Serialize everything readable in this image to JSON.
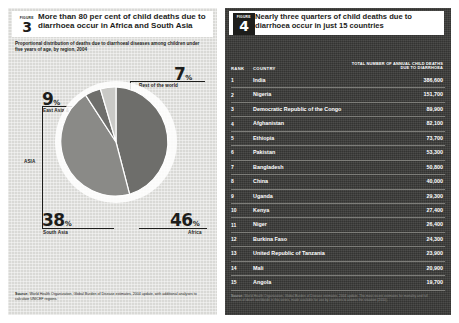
{
  "left": {
    "figure_word": "FIGURE",
    "figure_number": "3",
    "title": "More than 80 per cent of child deaths due to diarrhoea occur in Africa and South Asia",
    "subtitle": "Proportional distribution of deaths due to diarrhoeal diseases among children under five years of age, by region, 2004",
    "asia_bracket_label": "ASIA",
    "source_label": "Source:",
    "source_text": "World Health Organization, Global Burden of Disease estimates, 2004 update, with additional analyses to calculate UNICEF regions."
  },
  "right": {
    "figure_word": "FIGURE",
    "figure_number": "4",
    "title": "Nearly three quarters of child deaths due to diarrhoea occur in just 15 countries",
    "columns": {
      "rank": "RANK",
      "country": "COUNTRY",
      "deaths": "TOTAL NUMBER OF ANNUAL CHILD DEATHS DUE TO DIARRHOEA"
    },
    "rows": [
      {
        "rank": "1",
        "country": "India",
        "deaths": "386,600"
      },
      {
        "rank": "2",
        "country": "Nigeria",
        "deaths": "151,700"
      },
      {
        "rank": "3",
        "country": "Democratic Republic of the Congo",
        "deaths": "89,900"
      },
      {
        "rank": "4",
        "country": "Afghanistan",
        "deaths": "82,100"
      },
      {
        "rank": "5",
        "country": "Ethiopia",
        "deaths": "73,700"
      },
      {
        "rank": "6",
        "country": "Pakistan",
        "deaths": "53,300"
      },
      {
        "rank": "7",
        "country": "Bangladesh",
        "deaths": "50,800"
      },
      {
        "rank": "8",
        "country": "China",
        "deaths": "40,000"
      },
      {
        "rank": "9",
        "country": "Uganda",
        "deaths": "29,300"
      },
      {
        "rank": "10",
        "country": "Kenya",
        "deaths": "27,400"
      },
      {
        "rank": "11",
        "country": "Niger",
        "deaths": "26,400"
      },
      {
        "rank": "12",
        "country": "Burkina Faso",
        "deaths": "24,300"
      },
      {
        "rank": "13",
        "country": "United Republic of Tanzania",
        "deaths": "23,900"
      },
      {
        "rank": "14",
        "country": "Mali",
        "deaths": "20,900"
      },
      {
        "rank": "15",
        "country": "Angola",
        "deaths": "19,700"
      }
    ],
    "source_label": "Source:",
    "source_text": "World Health Organization, Global Burden of Disease estimates, 2004 update. The most recent estimates for mortality and full causes of death worldwide in this series, made available for use by countries to assess the situation (2010)."
  },
  "chart_data": {
    "type": "pie",
    "title": "Proportional distribution of deaths due to diarrhoeal diseases among children under five years of age, by region, 2004",
    "unit": "per cent",
    "labels": [
      "Africa",
      "South Asia",
      "East Asia & Pacific",
      "Rest of the world"
    ],
    "values": [
      46,
      38,
      9,
      7
    ],
    "colors": [
      "#6e6e6b",
      "#8a8a87",
      "#6e6e6b",
      "#c9c9c6"
    ],
    "start_angle_deg": 0,
    "direction": "clockwise",
    "legend": "inline-callouts",
    "grouping": {
      "ASIA": [
        "East Asia & Pacific",
        "South Asia"
      ]
    },
    "slice_labels": [
      {
        "label": "Africa",
        "value": "46",
        "suffix": "%"
      },
      {
        "label": "South Asia",
        "value": "38",
        "suffix": "%"
      },
      {
        "label": "East Asia & Pacific",
        "value": "9",
        "suffix": "%"
      },
      {
        "label": "Rest of the world",
        "value": "7",
        "suffix": "%"
      }
    ]
  }
}
